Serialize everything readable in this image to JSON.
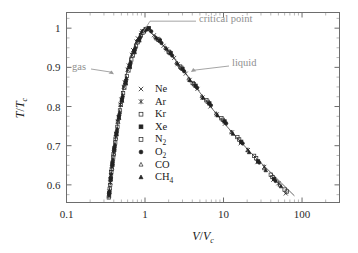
{
  "chart_data": {
    "type": "scatter",
    "title": "",
    "xlabel": "V/Vc",
    "ylabel": "T/Tc",
    "xscale": "log",
    "yscale": "linear",
    "xlim": [
      0.1,
      300
    ],
    "ylim": [
      0.555,
      1.04
    ],
    "grid": false,
    "legend_position": "center",
    "x_ticks": [
      "0.1",
      "1",
      "10",
      "100"
    ],
    "x_tick_values": [
      0.1,
      1,
      10,
      100
    ],
    "y_ticks": [
      "1",
      "0.9",
      "0.8",
      "0.7",
      "0.6"
    ],
    "y_tick_values": [
      1,
      0.9,
      0.8,
      0.7,
      0.6
    ],
    "annotations": [
      {
        "text": "critical point",
        "target_x": 1.0,
        "target_y": 1.0
      },
      {
        "text": "gas",
        "target_x": 0.42,
        "target_y": 0.88
      },
      {
        "text": "liquid",
        "target_x": 3.6,
        "target_y": 0.885
      }
    ],
    "fit_curve": {
      "name": "coexistence curve",
      "gas_branch_x": [
        0.345,
        0.352,
        0.362,
        0.375,
        0.392,
        0.412,
        0.436,
        0.463,
        0.495,
        0.533,
        0.578,
        0.632,
        0.7,
        0.782,
        0.88,
        1.0
      ],
      "gas_branch_y": [
        0.565,
        0.585,
        0.61,
        0.64,
        0.672,
        0.705,
        0.74,
        0.775,
        0.812,
        0.848,
        0.882,
        0.915,
        0.944,
        0.968,
        0.988,
        1.0
      ],
      "liquid_branch_x": [
        1.0,
        1.16,
        1.36,
        1.62,
        1.96,
        2.42,
        3.05,
        3.95,
        5.25,
        7.2,
        10.2,
        15.0,
        22.5,
        35.0,
        55.0,
        80.0
      ],
      "liquid_branch_y": [
        1.0,
        0.99,
        0.977,
        0.961,
        0.942,
        0.919,
        0.893,
        0.863,
        0.83,
        0.794,
        0.757,
        0.719,
        0.681,
        0.643,
        0.604,
        0.572
      ]
    },
    "series": [
      {
        "name": "Ne",
        "marker": "cross",
        "fill": "none",
        "points": [
          [
            0.352,
            0.583
          ],
          [
            0.368,
            0.625
          ],
          [
            0.386,
            0.656
          ],
          [
            0.408,
            0.694
          ],
          [
            0.43,
            0.73
          ],
          [
            0.462,
            0.772
          ],
          [
            0.5,
            0.818
          ],
          [
            0.552,
            0.862
          ],
          [
            0.62,
            0.905
          ],
          [
            0.705,
            0.944
          ],
          [
            0.81,
            0.974
          ],
          [
            0.925,
            0.992
          ],
          [
            1.3,
            0.982
          ],
          [
            1.72,
            0.955
          ],
          [
            2.35,
            0.924
          ],
          [
            3.3,
            0.884
          ],
          [
            4.65,
            0.845
          ],
          [
            6.8,
            0.8
          ],
          [
            10.4,
            0.756
          ],
          [
            16.5,
            0.706
          ],
          [
            27.0,
            0.658
          ],
          [
            43.0,
            0.613
          ],
          [
            62.0,
            0.578
          ]
        ]
      },
      {
        "name": "Ar",
        "marker": "asterisk",
        "fill": "solid",
        "points": [
          [
            0.348,
            0.572
          ],
          [
            0.362,
            0.606
          ],
          [
            0.38,
            0.645
          ],
          [
            0.4,
            0.682
          ],
          [
            0.424,
            0.722
          ],
          [
            0.452,
            0.762
          ],
          [
            0.488,
            0.805
          ],
          [
            0.536,
            0.85
          ],
          [
            0.6,
            0.894
          ],
          [
            0.68,
            0.932
          ],
          [
            0.782,
            0.966
          ],
          [
            0.9,
            0.988
          ],
          [
            1.05,
            0.998
          ],
          [
            1.42,
            0.973
          ],
          [
            1.9,
            0.946
          ],
          [
            2.6,
            0.908
          ],
          [
            3.7,
            0.868
          ],
          [
            5.4,
            0.823
          ],
          [
            8.2,
            0.78
          ],
          [
            12.8,
            0.734
          ],
          [
            20.5,
            0.689
          ],
          [
            33.0,
            0.646
          ],
          [
            50.0,
            0.604
          ]
        ]
      },
      {
        "name": "Kr",
        "marker": "square",
        "fill": "none",
        "points": [
          [
            0.355,
            0.59
          ],
          [
            0.372,
            0.632
          ],
          [
            0.393,
            0.67
          ],
          [
            0.417,
            0.708
          ],
          [
            0.445,
            0.748
          ],
          [
            0.48,
            0.79
          ],
          [
            0.525,
            0.834
          ],
          [
            0.588,
            0.878
          ],
          [
            0.668,
            0.92
          ],
          [
            0.768,
            0.955
          ],
          [
            0.888,
            0.982
          ],
          [
            1.02,
            0.997
          ],
          [
            1.5,
            0.97
          ],
          [
            2.05,
            0.938
          ],
          [
            2.9,
            0.899
          ],
          [
            4.2,
            0.857
          ],
          [
            6.3,
            0.812
          ],
          [
            9.8,
            0.766
          ],
          [
            15.8,
            0.716
          ],
          [
            26.0,
            0.668
          ],
          [
            42.0,
            0.62
          ],
          [
            64.0,
            0.583
          ]
        ]
      },
      {
        "name": "Xe",
        "marker": "square",
        "fill": "solid",
        "points": [
          [
            0.35,
            0.578
          ],
          [
            0.365,
            0.615
          ],
          [
            0.384,
            0.652
          ],
          [
            0.405,
            0.69
          ],
          [
            0.432,
            0.73
          ],
          [
            0.465,
            0.772
          ],
          [
            0.508,
            0.816
          ],
          [
            0.565,
            0.86
          ],
          [
            0.638,
            0.902
          ],
          [
            0.73,
            0.94
          ],
          [
            0.84,
            0.97
          ],
          [
            0.96,
            0.992
          ],
          [
            1.12,
            1.0
          ],
          [
            1.55,
            0.968
          ],
          [
            2.12,
            0.936
          ],
          [
            3.0,
            0.896
          ],
          [
            4.4,
            0.853
          ],
          [
            6.6,
            0.808
          ],
          [
            10.3,
            0.762
          ],
          [
            16.8,
            0.71
          ],
          [
            27.5,
            0.66
          ],
          [
            44.0,
            0.615
          ]
        ]
      },
      {
        "name": "N2",
        "marker": "square",
        "fill": "none",
        "points": [
          [
            0.346,
            0.568
          ],
          [
            0.36,
            0.6
          ],
          [
            0.377,
            0.64
          ],
          [
            0.398,
            0.678
          ],
          [
            0.422,
            0.718
          ],
          [
            0.452,
            0.76
          ],
          [
            0.492,
            0.804
          ],
          [
            0.545,
            0.848
          ],
          [
            0.615,
            0.892
          ],
          [
            0.7,
            0.93
          ],
          [
            0.805,
            0.964
          ],
          [
            0.93,
            0.988
          ],
          [
            1.08,
            0.999
          ],
          [
            1.48,
            0.971
          ],
          [
            2.0,
            0.94
          ],
          [
            2.8,
            0.902
          ],
          [
            4.05,
            0.86
          ],
          [
            6.05,
            0.816
          ],
          [
            9.4,
            0.77
          ],
          [
            15.0,
            0.722
          ],
          [
            24.5,
            0.674
          ],
          [
            40.0,
            0.626
          ],
          [
            60.0,
            0.588
          ]
        ]
      },
      {
        "name": "O2",
        "marker": "circle",
        "fill": "solid",
        "points": [
          [
            0.351,
            0.58
          ],
          [
            0.366,
            0.618
          ],
          [
            0.386,
            0.658
          ],
          [
            0.409,
            0.696
          ],
          [
            0.437,
            0.736
          ],
          [
            0.47,
            0.778
          ],
          [
            0.514,
            0.822
          ],
          [
            0.572,
            0.866
          ],
          [
            0.648,
            0.908
          ],
          [
            0.742,
            0.945
          ],
          [
            0.855,
            0.974
          ],
          [
            0.982,
            0.994
          ],
          [
            1.2,
            0.992
          ],
          [
            1.62,
            0.962
          ],
          [
            2.22,
            0.93
          ],
          [
            3.15,
            0.89
          ],
          [
            4.6,
            0.848
          ],
          [
            6.9,
            0.803
          ],
          [
            10.8,
            0.757
          ],
          [
            17.5,
            0.706
          ],
          [
            28.5,
            0.657
          ],
          [
            46.0,
            0.61
          ]
        ]
      },
      {
        "name": "CO",
        "marker": "triangle",
        "fill": "none",
        "points": [
          [
            0.349,
            0.574
          ],
          [
            0.364,
            0.612
          ],
          [
            0.383,
            0.65
          ],
          [
            0.405,
            0.688
          ],
          [
            0.433,
            0.728
          ],
          [
            0.466,
            0.77
          ],
          [
            0.51,
            0.814
          ],
          [
            0.568,
            0.858
          ],
          [
            0.642,
            0.9
          ],
          [
            0.736,
            0.938
          ],
          [
            0.848,
            0.968
          ],
          [
            0.975,
            0.991
          ],
          [
            1.35,
            0.978
          ],
          [
            1.82,
            0.95
          ],
          [
            2.52,
            0.912
          ],
          [
            3.6,
            0.871
          ],
          [
            5.3,
            0.826
          ],
          [
            8.05,
            0.782
          ],
          [
            12.6,
            0.735
          ],
          [
            20.2,
            0.688
          ],
          [
            33.0,
            0.642
          ],
          [
            52.0,
            0.6
          ]
        ]
      },
      {
        "name": "CH4",
        "marker": "triangle",
        "fill": "solid",
        "points": [
          [
            0.353,
            0.586
          ],
          [
            0.37,
            0.628
          ],
          [
            0.39,
            0.665
          ],
          [
            0.414,
            0.703
          ],
          [
            0.442,
            0.743
          ],
          [
            0.476,
            0.785
          ],
          [
            0.52,
            0.828
          ],
          [
            0.58,
            0.872
          ],
          [
            0.658,
            0.914
          ],
          [
            0.755,
            0.951
          ],
          [
            0.87,
            0.979
          ],
          [
            1.0,
            0.996
          ],
          [
            1.38,
            0.975
          ],
          [
            1.86,
            0.948
          ],
          [
            2.58,
            0.91
          ],
          [
            3.72,
            0.867
          ],
          [
            5.5,
            0.822
          ],
          [
            8.4,
            0.777
          ],
          [
            13.2,
            0.73
          ],
          [
            21.2,
            0.683
          ],
          [
            34.5,
            0.637
          ],
          [
            54.0,
            0.596
          ]
        ]
      }
    ]
  },
  "legend": {
    "entries": [
      {
        "label": "Ne",
        "base": "Ne",
        "sub": ""
      },
      {
        "label": "Ar",
        "base": "Ar",
        "sub": ""
      },
      {
        "label": "Kr",
        "base": "Kr",
        "sub": ""
      },
      {
        "label": "Xe",
        "base": "Xe",
        "sub": ""
      },
      {
        "label": "N2",
        "base": "N",
        "sub": "2"
      },
      {
        "label": "O2",
        "base": "O",
        "sub": "2"
      },
      {
        "label": "CO",
        "base": "CO",
        "sub": ""
      },
      {
        "label": "CH4",
        "base": "CH",
        "sub": "4"
      }
    ]
  },
  "axes": {
    "y_title_numerator": "T",
    "y_title_slash": "/",
    "y_title_denominator": "T",
    "y_title_subscript": "c",
    "x_title_numerator": "V",
    "x_title_slash": "/",
    "x_title_denominator": "V",
    "x_title_subscript": "c"
  },
  "colors": {
    "background": "#ffffff",
    "frame": "#6d6d6d",
    "marker": "#222222",
    "fit_line": "#555555",
    "annotation_text": "#8f8f8f",
    "annotation_line": "#9b9b9b",
    "tick_text": "#2b2b2b"
  }
}
